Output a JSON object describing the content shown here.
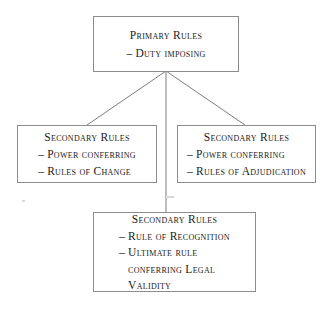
{
  "diagram": {
    "background_color": "#ffffff",
    "border_color": "#8d8d8d",
    "text_color": "#1a1a1a",
    "nodes": {
      "primary": {
        "title": "Primary Rules",
        "lines": [
          {
            "dash": "–",
            "text": "Duty imposing"
          }
        ]
      },
      "secondary_change": {
        "title": "Secondary Rules",
        "lines": [
          {
            "dash": "–",
            "text": "Power conferring"
          },
          {
            "dash": "–",
            "text": "Rules of Change"
          }
        ]
      },
      "secondary_adjudication": {
        "title": "Secondary Rules",
        "lines": [
          {
            "dash": "–",
            "text": "Power conferring"
          },
          {
            "dash": "–",
            "text": "Rules of Adjudication"
          }
        ]
      },
      "secondary_recognition": {
        "title": "Secondary Rules",
        "lines": [
          {
            "dash": "–",
            "text": "Rule of Recognition"
          },
          {
            "dash": "–",
            "text": "Ultimate rule"
          },
          {
            "dash": "",
            "text": "conferring Legal"
          },
          {
            "dash": "",
            "text": "Validity"
          }
        ]
      }
    },
    "connectors": [
      {
        "name": "primary-to-left",
        "from": "primary",
        "to": "secondary_change"
      },
      {
        "name": "primary-to-right",
        "from": "primary",
        "to": "secondary_adjudication"
      },
      {
        "name": "primary-to-bottom",
        "from": "primary",
        "to": "secondary_recognition"
      }
    ]
  }
}
